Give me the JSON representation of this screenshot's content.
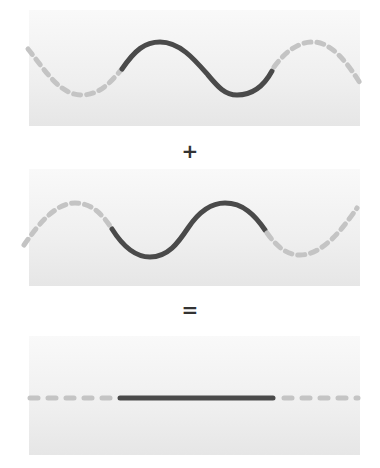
{
  "diagram": {
    "title": "",
    "operators": {
      "plus": "+",
      "equals": "="
    },
    "colors": {
      "solid_stroke": "#4a4a4a",
      "dashed_stroke": "#c4c4c4",
      "panel_top": "#f9f9f9",
      "panel_bottom": "#e6e6e6"
    },
    "panels": [
      {
        "id": "wave-1",
        "label": "Wave",
        "phase": "0"
      },
      {
        "id": "wave-2",
        "label": "Inverted wave",
        "phase": "180"
      },
      {
        "id": "result",
        "label": "Sum (flat line)",
        "phase": ""
      }
    ]
  }
}
